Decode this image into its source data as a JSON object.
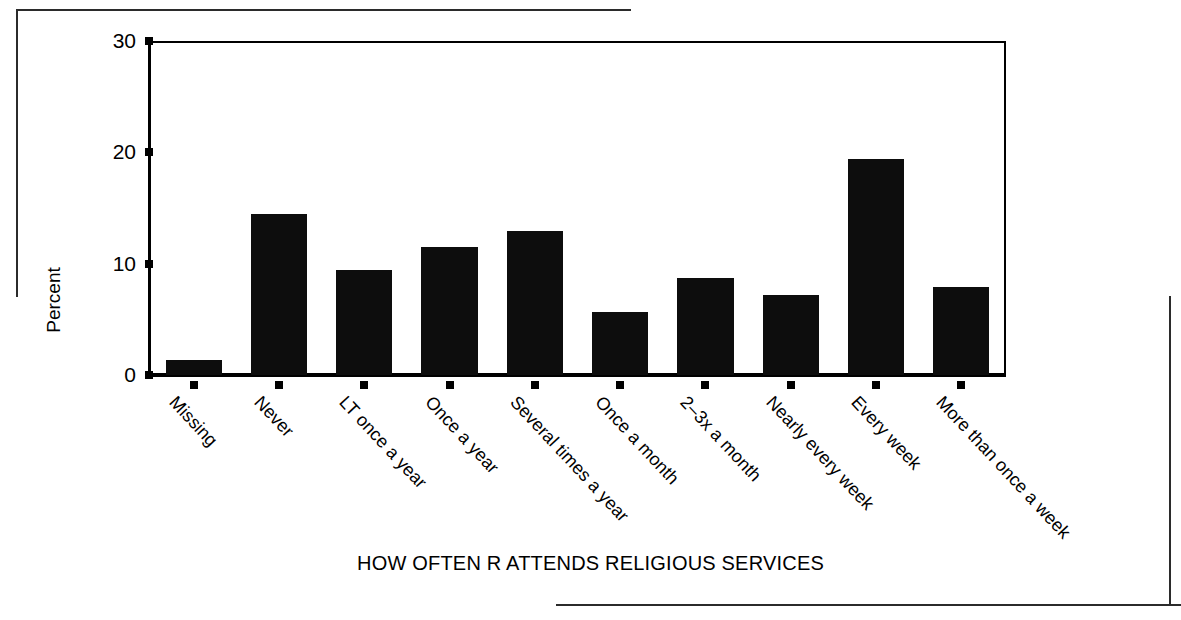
{
  "chart_data": {
    "type": "bar",
    "title": "",
    "xlabel": "HOW OFTEN R ATTENDS RELIGIOUS SERVICES",
    "ylabel": "Percent",
    "ylim": [
      0,
      30
    ],
    "yticks": [
      0,
      10,
      20,
      30
    ],
    "ytick_labels": [
      "0",
      "10",
      "20",
      "30"
    ],
    "grid": false,
    "legend": "none",
    "bar_color": "#0d0d0d",
    "categories": [
      "Missing",
      "Never",
      "LT once a year",
      "Once a year",
      "Several times a year",
      "Once a month",
      "2–3x a month",
      "Nearly every week",
      "Every week",
      "More than once a week"
    ],
    "values": [
      1.5,
      14.6,
      9.6,
      11.7,
      13.1,
      5.8,
      8.9,
      7.4,
      19.6,
      8.1
    ]
  }
}
